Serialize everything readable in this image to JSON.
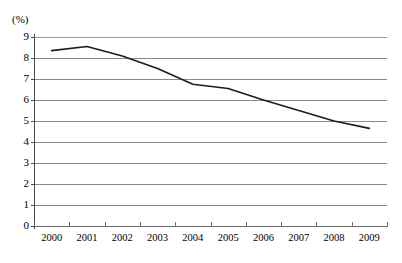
{
  "chart_data": {
    "type": "line",
    "title": "",
    "subtitle": "",
    "xlabel": "",
    "ylabel": "",
    "unit_label": "(%)",
    "categories": [
      "2000",
      "2001",
      "2002",
      "2003",
      "2004",
      "2005",
      "2006",
      "2007",
      "2008",
      "2009"
    ],
    "series": [
      {
        "name": "",
        "values": [
          8.35,
          8.55,
          8.1,
          7.5,
          6.75,
          6.55,
          6.0,
          5.5,
          5.0,
          4.65
        ]
      }
    ],
    "ylim": [
      0,
      9
    ],
    "ytick_labels": [
      "9",
      "8",
      "7",
      "6",
      "5",
      "4",
      "3",
      "2",
      "1",
      "0"
    ],
    "ytick_values": [
      9,
      8,
      7,
      6,
      5,
      4,
      3,
      2,
      1,
      0
    ],
    "grid": true,
    "grid_axis": "y",
    "legend": false,
    "legend_position": "none",
    "line_color": "#1c1c1c",
    "grid_color": "#8a8a8a",
    "axis_color": "#4a4a4a",
    "background_color": "#ffffff"
  }
}
